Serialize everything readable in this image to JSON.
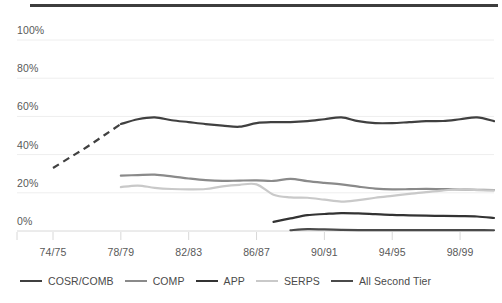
{
  "chart_data": {
    "type": "line",
    "title": "",
    "subtitle": "",
    "xlabel": "",
    "ylabel": "",
    "ylim": [
      0,
      100
    ],
    "yticks": [
      "0%",
      "20%",
      "40%",
      "60%",
      "80%",
      "100%"
    ],
    "ytick_values": [
      0,
      20,
      40,
      60,
      80,
      100
    ],
    "grid": true,
    "legend_position": "bottom",
    "x": [
      "74/75",
      "75/76",
      "76/77",
      "77/78",
      "78/79",
      "79/80",
      "80/81",
      "81/82",
      "82/83",
      "83/84",
      "84/85",
      "85/86",
      "86/87",
      "87/88",
      "88/89",
      "89/90",
      "90/91",
      "91/92",
      "92/93",
      "93/94",
      "94/95",
      "95/96",
      "96/97",
      "97/98",
      "98/99",
      "99/00",
      "00/01"
    ],
    "xtick_labels": [
      "74/75",
      "78/79",
      "82/83",
      "86/87",
      "90/91",
      "94/95",
      "98/99"
    ],
    "xtick_indices": [
      0,
      4,
      8,
      12,
      16,
      20,
      24
    ],
    "series": [
      {
        "name": "COSR/COMB",
        "color": "#404040",
        "width": 2.2,
        "dashed_segment": true,
        "dash_note": "dashed from 74/75 to 78/79, solid thereafter",
        "values": [
          33,
          38.5,
          44,
          50,
          56,
          58.5,
          59.5,
          58,
          57,
          56,
          55.2,
          54.6,
          56.5,
          57,
          57,
          57.5,
          58.5,
          59.5,
          57.5,
          56.5,
          56.5,
          57,
          57.5,
          57.6,
          58.5,
          59.5,
          57.5
        ]
      },
      {
        "name": "COMP",
        "color": "#8a8a8a",
        "width": 2.2,
        "values": [
          null,
          null,
          null,
          null,
          29,
          29.3,
          29.5,
          28.6,
          27.5,
          26.6,
          26.2,
          26.4,
          26.5,
          26.2,
          27.3,
          26.1,
          25.2,
          24.4,
          23.2,
          22.2,
          21.8,
          21.9,
          22.1,
          21.9,
          21.8,
          21.6,
          21.4
        ]
      },
      {
        "name": "APP",
        "color": "#333333",
        "width": 2.2,
        "values": [
          null,
          null,
          null,
          null,
          null,
          null,
          null,
          null,
          null,
          null,
          null,
          null,
          null,
          4.8,
          6.6,
          8.3,
          8.9,
          9.4,
          9.2,
          8.8,
          8.4,
          8.2,
          8.0,
          7.9,
          7.8,
          7.6,
          6.8
        ]
      },
      {
        "name": "SERPS",
        "color": "#c9c9c9",
        "width": 2.2,
        "values": [
          null,
          null,
          null,
          null,
          23,
          23.8,
          22.6,
          22.0,
          21.8,
          22.0,
          23.4,
          24.2,
          24.4,
          19.0,
          17.6,
          17.4,
          16.4,
          15.4,
          16.2,
          17.4,
          18.4,
          19.4,
          20.4,
          21.2,
          21.9,
          21.4,
          21.3
        ]
      },
      {
        "name": "All Second Tier",
        "color": "#4a4a4a",
        "width": 2.2,
        "values": [
          null,
          null,
          null,
          null,
          null,
          null,
          null,
          null,
          null,
          null,
          null,
          null,
          null,
          null,
          0.4,
          1.0,
          0.8,
          0.6,
          0.5,
          0.5,
          0.5,
          0.5,
          0.5,
          0.5,
          0.5,
          0.5,
          0.4
        ]
      }
    ]
  },
  "legend": {
    "items": [
      {
        "label": "COSR/COMB",
        "color": "#404040"
      },
      {
        "label": "COMP",
        "color": "#8a8a8a"
      },
      {
        "label": "APP",
        "color": "#333333"
      },
      {
        "label": "SERPS",
        "color": "#c9c9c9"
      },
      {
        "label": "All Second Tier",
        "color": "#4a4a4a"
      }
    ]
  },
  "style": {
    "background": "#ffffff",
    "gridline_color": "#eeeeee",
    "axis_color": "#d8d8d8",
    "top_rule_color": "#3d3d3d",
    "text_color": "#595959"
  }
}
